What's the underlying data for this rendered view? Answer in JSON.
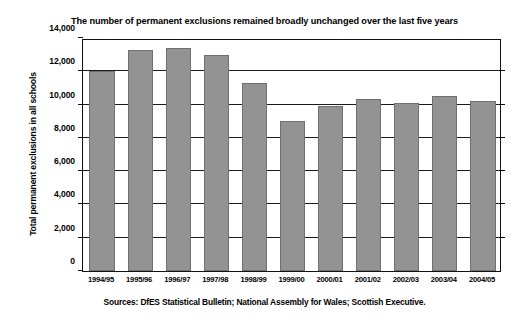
{
  "chart_data": {
    "type": "bar",
    "title": "The number of permanent exclusions remained broadly unchanged over the last five years",
    "xlabel": "",
    "ylabel": "Total permanent exclusions in all schools",
    "categories": [
      "1994/95",
      "1995/96",
      "1996/97",
      "1997/98",
      "1998/99",
      "1999/00",
      "2000/01",
      "2001/02",
      "2002/03",
      "2003/04",
      "2004/05"
    ],
    "values": [
      12000,
      13300,
      13400,
      13000,
      11300,
      9000,
      9900,
      10350,
      10100,
      10500,
      10200
    ],
    "ylim": [
      0,
      14000
    ],
    "ytick_values": [
      0,
      2000,
      4000,
      6000,
      8000,
      10000,
      12000,
      14000
    ],
    "ytick_labels": [
      "0",
      "2,000",
      "4,000",
      "6,000",
      "8,000",
      "10,000",
      "12,000",
      "14,000"
    ],
    "grid": true,
    "legend": false,
    "bar_color": "#939393",
    "bar_edge_color": "#6f6f6f",
    "axis_color": "#111111",
    "background_color": "#ffffff",
    "source_note": "Sources: DfES Statistical Bulletin; National Assembly for Wales; Scottish Executive."
  }
}
